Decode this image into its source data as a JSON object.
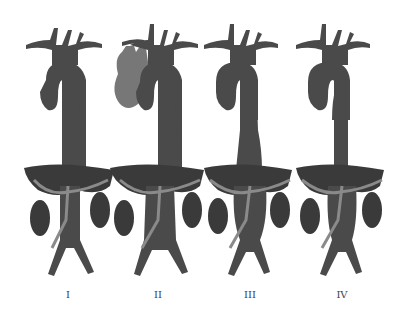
{
  "diagram": {
    "colors": {
      "aorta": "#4a4a4a",
      "aneurysm_heart": "#777777",
      "liver_kidney": "#3a3a3a",
      "vessel_light": "#8a8a8a",
      "background": "#ffffff",
      "label": "#444444"
    },
    "figures": [
      {
        "id": "I",
        "label": "I",
        "dilated": "thoracoabdominal upper"
      },
      {
        "id": "II",
        "label": "II",
        "dilated": "full thoracoabdominal with arch aneurysm"
      },
      {
        "id": "III",
        "label": "III",
        "dilated": "lower thoracic and abdominal"
      },
      {
        "id": "IV",
        "label": "IV",
        "dilated": "abdominal"
      }
    ]
  }
}
